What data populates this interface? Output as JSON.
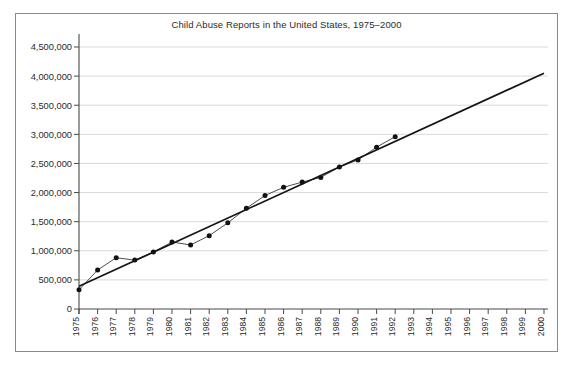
{
  "chart_data": {
    "type": "line",
    "title": "Child Abuse Reports in the United States, 1975–2000",
    "xlabel": "",
    "ylabel": "",
    "xlim": [
      1975,
      2000
    ],
    "ylim": [
      0,
      4500000
    ],
    "grid": true,
    "legend": false,
    "x_tick_labels": [
      "1975",
      "1976",
      "1977",
      "1978",
      "1979",
      "1980",
      "1981",
      "1982",
      "1983",
      "1984",
      "1985",
      "1986",
      "1987",
      "1988",
      "1989",
      "1990",
      "1991",
      "1992",
      "1993",
      "1994",
      "1995",
      "1996",
      "1997",
      "1998",
      "1999",
      "2000"
    ],
    "y_tick_labels": [
      "0",
      "500,000",
      "1,000,000",
      "1,500,000",
      "2,000,000",
      "2,500,000",
      "3,000,000",
      "3,500,000",
      "4,000,000",
      "4,500,000"
    ],
    "y_tick_values": [
      0,
      500000,
      1000000,
      1500000,
      2000000,
      2500000,
      3000000,
      3500000,
      4000000,
      4500000
    ],
    "series": [
      {
        "name": "Child abuse reports",
        "marker": "filled-circle",
        "x": [
          1975,
          1976,
          1977,
          1978,
          1979,
          1980,
          1981,
          1982,
          1983,
          1984,
          1985,
          1986,
          1987,
          1988,
          1989,
          1990,
          1991,
          1992
        ],
        "values": [
          330000,
          670000,
          880000,
          840000,
          980000,
          1150000,
          1100000,
          1260000,
          1480000,
          1730000,
          1950000,
          2090000,
          2180000,
          2260000,
          2440000,
          2560000,
          2780000,
          2960000
        ]
      }
    ],
    "trendline": {
      "name": "Linear trend",
      "x": [
        1975,
        2000
      ],
      "values": [
        390000,
        4050000
      ]
    },
    "annotations": []
  }
}
